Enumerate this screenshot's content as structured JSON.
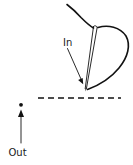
{
  "figure": {
    "background_color": "#ffffff",
    "ink_color": "#121212",
    "width": 133,
    "height": 165
  },
  "labels": {
    "in": "In",
    "out": "Out"
  },
  "annotations": [
    {
      "name": "in-label",
      "text": "In",
      "x": 63,
      "y": 45,
      "arrow_from": [
        68,
        49
      ],
      "arrow_to": [
        83,
        83
      ],
      "description": "Arrow pointing down-right to the needle tip entry point"
    },
    {
      "name": "out-label",
      "text": "Out",
      "x": 9,
      "y": 155,
      "arrow_from": [
        21,
        143
      ],
      "arrow_to": [
        21,
        110
      ],
      "description": "Arrow pointing up to the exit dot"
    }
  ],
  "elements": {
    "dashed_line": {
      "name": "tissue-surface-line",
      "x1": 38,
      "y1": 98,
      "x2": 121,
      "y2": 98,
      "dash_pattern": "6 4"
    },
    "exit_point_dot": {
      "name": "exit-point-dot",
      "cx": 21,
      "cy": 105,
      "r": 1.8
    },
    "needle": {
      "name": "curved-needle",
      "tip": [
        85,
        89
      ],
      "eye": [
        96,
        28
      ],
      "shape": "straight tapered shaft drawn as two near-parallel lines"
    },
    "thread": {
      "name": "suture-thread",
      "tail_start": [
        67,
        5
      ],
      "loop_extent_right": 128,
      "description": "Thread enters top-left, passes through needle eye, loops right and returns to needle tip"
    }
  }
}
